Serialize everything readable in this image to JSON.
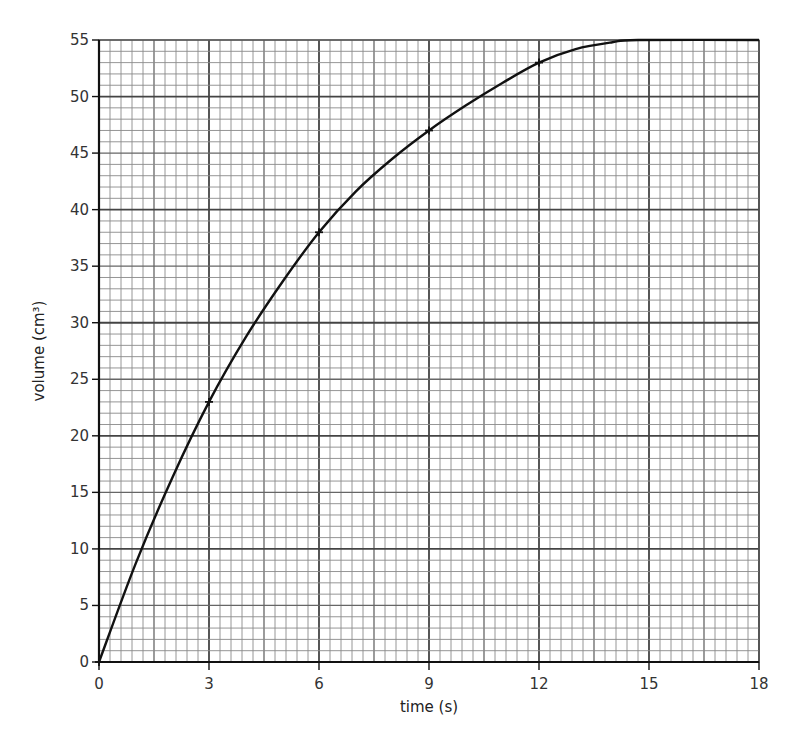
{
  "chart_data": {
    "type": "line",
    "title": "",
    "xlabel": "time (s)",
    "ylabel": "volume (cm³)",
    "xlim": [
      0,
      18
    ],
    "ylim": [
      0,
      55
    ],
    "xticks": [
      0,
      3,
      6,
      9,
      12,
      15,
      18
    ],
    "yticks": [
      0,
      5,
      10,
      15,
      20,
      25,
      30,
      35,
      40,
      45,
      50,
      55
    ],
    "grid": true,
    "legend": null,
    "series": [
      {
        "name": "volume",
        "marked_points": [
          {
            "x": 0,
            "y": 0
          },
          {
            "x": 3,
            "y": 23
          },
          {
            "x": 6,
            "y": 38
          },
          {
            "x": 9,
            "y": 47
          },
          {
            "x": 12,
            "y": 53
          }
        ],
        "curve": [
          {
            "x": 0,
            "y": 0
          },
          {
            "x": 1,
            "y": 8.7
          },
          {
            "x": 2,
            "y": 16.3
          },
          {
            "x": 3,
            "y": 23
          },
          {
            "x": 4,
            "y": 28.7
          },
          {
            "x": 5,
            "y": 33.6
          },
          {
            "x": 6,
            "y": 38
          },
          {
            "x": 7,
            "y": 41.6
          },
          {
            "x": 8,
            "y": 44.5
          },
          {
            "x": 9,
            "y": 47
          },
          {
            "x": 10,
            "y": 49.2
          },
          {
            "x": 11,
            "y": 51.2
          },
          {
            "x": 12,
            "y": 53
          },
          {
            "x": 13,
            "y": 54.2
          },
          {
            "x": 14,
            "y": 54.8
          },
          {
            "x": 14.7,
            "y": 55
          },
          {
            "x": 18,
            "y": 55
          }
        ]
      }
    ]
  },
  "axes": {
    "x_label": "time (s)",
    "y_label": "volume (cm³)"
  }
}
